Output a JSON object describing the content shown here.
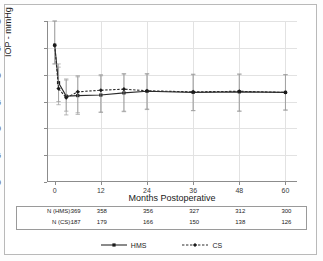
{
  "chart_data": {
    "type": "line",
    "title": "",
    "xlabel": "Months Postoperative",
    "ylabel": "IOP - mmHg",
    "xlim": [
      -2,
      63
    ],
    "ylim": [
      0,
      30
    ],
    "xticks": [
      0,
      12,
      24,
      36,
      48,
      60
    ],
    "yticks": [
      0,
      5,
      10,
      15,
      20,
      25,
      30
    ],
    "grid": true,
    "legend_position": "bottom",
    "x": [
      0,
      1,
      3,
      6,
      12,
      18,
      24,
      36,
      48,
      60
    ],
    "series": [
      {
        "name": "HMS",
        "style": "solid",
        "marker": "square",
        "values": [
          25.5,
          18.5,
          16.0,
          16.1,
          16.2,
          16.6,
          16.9,
          16.7,
          16.8,
          16.7
        ],
        "err_low": [
          22.0,
          15.0,
          13.2,
          12.6,
          13.0,
          13.2,
          13.6,
          13.3,
          13.2,
          13.4
        ],
        "err_high": [
          30.0,
          22.0,
          19.2,
          19.6,
          19.8,
          20.1,
          20.2,
          20.1,
          20.1,
          20.0
        ]
      },
      {
        "name": "CS",
        "style": "dashed",
        "marker": "diamond",
        "values": [
          25.5,
          17.4,
          15.7,
          16.8,
          17.1,
          17.3,
          17.0,
          16.8,
          16.9,
          16.7
        ],
        "err_low": [
          22.0,
          14.4,
          12.5,
          12.9,
          13.0,
          13.1,
          13.5,
          13.3,
          13.2,
          13.4
        ],
        "err_high": [
          30.0,
          21.4,
          19.0,
          19.8,
          20.0,
          20.2,
          20.1,
          20.0,
          20.1,
          20.0
        ]
      }
    ]
  },
  "ntable": {
    "x_positions": [
      0,
      12,
      24,
      36,
      48,
      60
    ],
    "rows": [
      {
        "label": "N (HMS):",
        "values": [
          "369",
          "358",
          "356",
          "327",
          "312",
          "300"
        ]
      },
      {
        "label": "N (CS):",
        "values": [
          "187",
          "179",
          "166",
          "150",
          "138",
          "126"
        ]
      }
    ]
  },
  "legend": {
    "items": [
      {
        "label": "HMS",
        "style": "solid",
        "color": "#2b2b2b"
      },
      {
        "label": "CS",
        "style": "dashed",
        "color": "#2b2b2b"
      }
    ]
  },
  "colors": {
    "hms": "#2b2b2b",
    "cs": "#2b2b2b",
    "grid": "#e2e2e2",
    "axis": "#8c8c8c",
    "text": "#1a1a1a",
    "border": "#b9b9b9",
    "background": "#ffffff"
  }
}
